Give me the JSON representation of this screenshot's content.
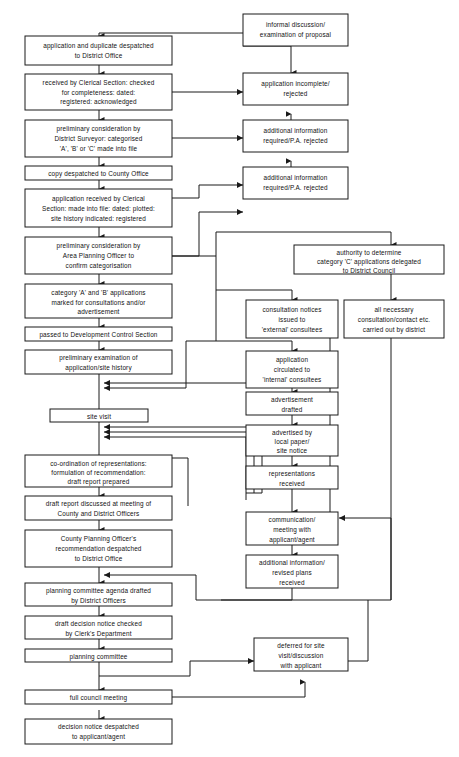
{
  "diagram": {
    "background_color": "#ffffff",
    "line_color": "#1a1a1a",
    "text_color": "#111111",
    "nodes": {
      "informal_discussion": "informal discussion/\nexamination of proposal",
      "application_duplicate": "application and duplicate despatched\nto District Office",
      "received_clerical": "received by Clerical Section: checked\nfor completeness: dated:\nregistered: acknowledged",
      "application_incomplete": "application incomplete/\nrejected",
      "preliminary_district_surveyor": "preliminary consideration by\nDistrict Surveyor: categorised\n'A', 'B' or 'C' made into file",
      "additional_info_1": "additional information\nrequired/P.A. rejected",
      "copy_county_office": "copy despatched to County Office",
      "application_received_clerical": "application received by Clerical\nSection: made into file: dated: plotted:\nsite history indicated: registered",
      "additional_info_2": "additional information\nrequired/P.A. rejected",
      "preliminary_area_planning": "preliminary consideration by\nArea Planning Officer to\nconfirm categorisation",
      "authority_determine": "authority to determine\ncategory 'C' applications delegated\nto District Council",
      "category_ab": "category 'A' and 'B' applications\nmarked for consultations and/or\nadvertisement",
      "consultation_notices": "consultation notices\nissued to\n'external' consultees",
      "all_necessary_consultation": "all necessary\nconsultation/contact etc.\ncarried out by district",
      "passed_development_control": "passed to Development Control Section",
      "preliminary_examination": "preliminary examination of\napplication/site history",
      "application_circulated": "application\ncirculated to\n'internal' consultees",
      "site_visit": "site visit",
      "advertisement_drafted": "advertisement\ndrafted",
      "coordination_representations": "co-ordination of representations:\nformulation of recommendation:\ndraft report prepared",
      "advertised_local_paper": "advertised by\nlocal paper/\nsite notice",
      "draft_report_discussed": "draft report discussed at meeting of\nCounty and District Officers",
      "representations_received": "representations\nreceived",
      "county_planning_officer": "County Planning Officer's\nrecommendation despatched\nto District Office",
      "communication_meeting": "communication/\nmeeting with\napplicant/agent",
      "planning_committee_agenda": "planning committee agenda drafted\nby District Officers",
      "additional_info_revised": "additional information/\nrevised plans\nreceived",
      "draft_decision_notice": "draft decision notice checked\nby Clerk's Department",
      "planning_committee": "planning committee",
      "deferred_site_visit": "deferred for site\nvisit/discussion\nwith applicant",
      "full_council_meeting": "full council meeting",
      "decision_notice_despatched": "decision notice despatched\nto applicant/agent"
    },
    "node_lines": {
      "informal_discussion": [
        "informal discussion/",
        "examination of proposal"
      ],
      "application_duplicate": [
        "application and duplicate despatched",
        "to District Office"
      ],
      "received_clerical": [
        "received by Clerical Section: checked",
        "for completeness: dated:",
        "registered: acknowledged"
      ],
      "application_incomplete": [
        "application incomplete/",
        "rejected"
      ],
      "preliminary_district_surveyor": [
        "preliminary consideration by",
        "District Surveyor: categorised",
        "'A', 'B' or 'C' made into file"
      ],
      "additional_info_1": [
        "additional information",
        "required/P.A. rejected"
      ],
      "copy_county_office": [
        "copy despatched to County Office"
      ],
      "application_received_clerical": [
        "application received by Clerical",
        "Section: made into file: dated: plotted:",
        "site history indicated: registered"
      ],
      "additional_info_2": [
        "additional information",
        "required/P.A. rejected"
      ],
      "preliminary_area_planning": [
        "preliminary consideration by",
        "Area Planning Officer to",
        "confirm categorisation"
      ],
      "authority_determine": [
        "authority to determine",
        "category 'C' applications delegated",
        "to District Council"
      ],
      "category_ab": [
        "category 'A' and 'B' applications",
        "marked for consultations and/or",
        "advertisement"
      ],
      "consultation_notices": [
        "consultation notices",
        "issued to",
        "'external' consultees"
      ],
      "all_necessary_consultation": [
        "all necessary",
        "consultation/contact etc.",
        "carried out by district"
      ],
      "passed_development_control": [
        "passed to Development Control Section"
      ],
      "preliminary_examination": [
        "preliminary examination of",
        "application/site history"
      ],
      "application_circulated": [
        "application",
        "circulated to",
        "'internal' consultees"
      ],
      "site_visit": [
        "site visit"
      ],
      "advertisement_drafted": [
        "advertisement",
        "drafted"
      ],
      "coordination_representations": [
        "co-ordination of representations:",
        "formulation of recommendation:",
        "draft report prepared"
      ],
      "advertised_local_paper": [
        "advertised by",
        "local paper/",
        "site notice"
      ],
      "draft_report_discussed": [
        "draft report discussed at meeting of",
        "County and District Officers"
      ],
      "representations_received": [
        "representations",
        "received"
      ],
      "county_planning_officer": [
        "County Planning Officer's",
        "recommendation despatched",
        "to District Office"
      ],
      "communication_meeting": [
        "communication/",
        "meeting with",
        "applicant/agent"
      ],
      "planning_committee_agenda": [
        "planning committee agenda drafted",
        "by District Officers"
      ],
      "additional_info_revised": [
        "additional information/",
        "revised plans",
        "received"
      ],
      "draft_decision_notice": [
        "draft decision notice checked",
        "by Clerk's Department"
      ],
      "planning_committee": [
        "planning committee"
      ],
      "deferred_site_visit": [
        "deferred for site",
        "visit/discussion",
        "with applicant"
      ],
      "full_council_meeting": [
        "full council meeting"
      ],
      "decision_notice_despatched": [
        "decision notice despatched",
        "to applicant/agent"
      ]
    }
  }
}
